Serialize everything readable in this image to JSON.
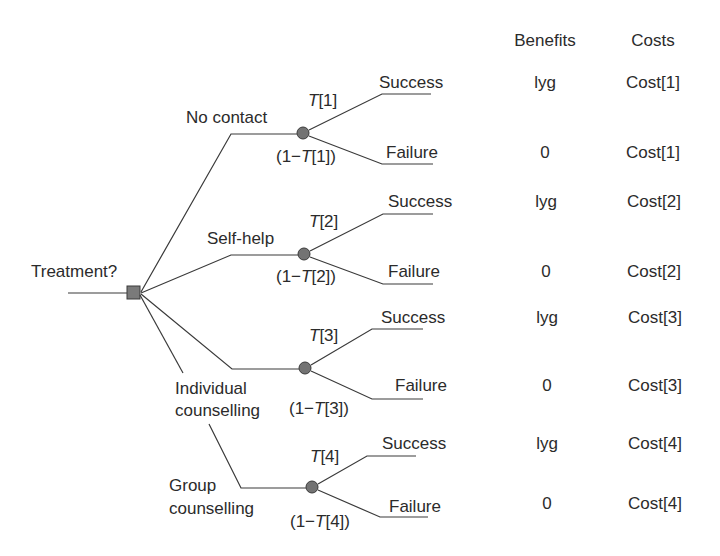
{
  "decision": {
    "label": "Treatment?",
    "node_color": "#7a7a7a"
  },
  "columns": {
    "benefits": "Benefits",
    "costs": "Costs"
  },
  "chance_node_color": "#737373",
  "branches": [
    {
      "label_lines": [
        "No contact"
      ],
      "prob_success": {
        "var": "T",
        "index": "[1]"
      },
      "prob_failure": {
        "prefix": "(1−",
        "var": "T",
        "index": "[1])"
      },
      "outcomes": [
        {
          "label": "Success",
          "benefit": "lyg",
          "cost": "Cost[1]"
        },
        {
          "label": "Failure",
          "benefit": "0",
          "cost": "Cost[1]"
        }
      ]
    },
    {
      "label_lines": [
        "Self-help"
      ],
      "prob_success": {
        "var": "T",
        "index": "[2]"
      },
      "prob_failure": {
        "prefix": "(1−",
        "var": "T",
        "index": "[2])"
      },
      "outcomes": [
        {
          "label": "Success",
          "benefit": "lyg",
          "cost": "Cost[2]"
        },
        {
          "label": "Failure",
          "benefit": "0",
          "cost": "Cost[2]"
        }
      ]
    },
    {
      "label_lines": [
        "Individual",
        "counselling"
      ],
      "prob_success": {
        "var": "T",
        "index": "[3]"
      },
      "prob_failure": {
        "prefix": "(1−",
        "var": "T",
        "index": "[3])"
      },
      "outcomes": [
        {
          "label": "Success",
          "benefit": "lyg",
          "cost": "Cost[3]"
        },
        {
          "label": "Failure",
          "benefit": "0",
          "cost": "Cost[3]"
        }
      ]
    },
    {
      "label_lines": [
        "Group",
        "counselling"
      ],
      "prob_success": {
        "var": "T",
        "index": "[4]"
      },
      "prob_failure": {
        "prefix": "(1−",
        "var": "T",
        "index": "[4])"
      },
      "outcomes": [
        {
          "label": "Success",
          "benefit": "lyg",
          "cost": "Cost[4]"
        },
        {
          "label": "Failure",
          "benefit": "0",
          "cost": "Cost[4]"
        }
      ]
    }
  ]
}
